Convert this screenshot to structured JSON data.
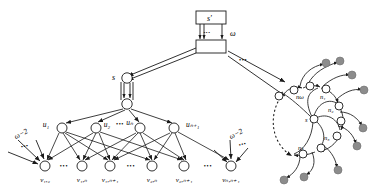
{
  "figure": {
    "colors": {
      "stroke": "#1a1a1a",
      "node_fill": "#ffffff",
      "filled_node": "#8c8c8c",
      "background": "#ffffff"
    }
  },
  "top_box": {
    "source_label": "s'",
    "weight_label": "ω",
    "dots": "•••"
  },
  "middle": {
    "s_label": "s",
    "dots": "•••"
  },
  "layer_u": {
    "labels": [
      "u₁",
      "u₂",
      "uₙ",
      "uₙ₊₁"
    ],
    "dots": "•••",
    "nodes": [
      {
        "name": "u1",
        "cx": 62,
        "cy": 128,
        "label": "u₁",
        "lx": 46,
        "ly": 124
      },
      {
        "name": "u2",
        "cx": 96,
        "cy": 128,
        "label": "u₂",
        "lx": 102,
        "ly": 124
      },
      {
        "name": "un",
        "cx": 140,
        "cy": 128,
        "label": "uₙ",
        "lx": 124,
        "ly": 124
      },
      {
        "name": "un1",
        "cx": 174,
        "cy": 128,
        "label": "uₙ₊₁",
        "lx": 185,
        "ly": 124
      }
    ]
  },
  "layer_v": {
    "dots": "•••",
    "nodes": [
      {
        "name": "v12",
        "cx": 45,
        "cy": 166,
        "label": "v₁,₂",
        "lx": 45
      },
      {
        "name": "v1n",
        "cx": 82,
        "cy": 166,
        "label": "v₁,ₙ",
        "lx": 82
      },
      {
        "name": "v1n1",
        "cx": 110,
        "cy": 166,
        "label": "v₁,ₙ₊₁",
        "lx": 110
      },
      {
        "name": "v2n",
        "cx": 152,
        "cy": 166,
        "label": "v₂,ₙ",
        "lx": 152
      },
      {
        "name": "v2n1",
        "cx": 184,
        "cy": 166,
        "label": "v₂,ₙ₊₁",
        "lx": 184
      },
      {
        "name": "vnn1",
        "cx": 231,
        "cy": 166,
        "label": "vₙ,ₙ₊₁",
        "lx": 231
      }
    ]
  },
  "side_weights": {
    "left_label": "ω−2",
    "right_label": "ω−2",
    "dots": "•••"
  },
  "spiral": {
    "center_label": "s",
    "arm_labels": [
      "nω",
      "n₁",
      "n₂",
      "n₃",
      "nₖ"
    ],
    "nodes": [
      {
        "name": "nomega",
        "label": "nω",
        "cx": 294,
        "cy": 90,
        "lx": 297,
        "ly": 97
      },
      {
        "name": "n1",
        "label": "n₁",
        "cx": 318,
        "cy": 88,
        "lx": 320,
        "ly": 97
      },
      {
        "name": "n2",
        "label": "n₂",
        "cx": 338,
        "cy": 108,
        "lx": 330,
        "ly": 112
      },
      {
        "name": "n3",
        "label": "n₃",
        "cx": 332,
        "cy": 132,
        "lx": 327,
        "ly": 137
      },
      {
        "name": "nk",
        "label": "nₖ",
        "cx": 305,
        "cy": 150,
        "lx": 302,
        "ly": 152
      }
    ]
  }
}
